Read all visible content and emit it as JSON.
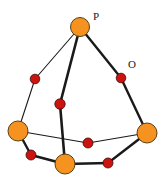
{
  "figure": {
    "background_color": "#ffffff",
    "width": 163,
    "height": 181
  },
  "style": {
    "phosphorus_fill": "#f59220",
    "phosphorus_stroke": "#5a4012",
    "oxygen_fill": "#cc1310",
    "oxygen_stroke": "#3d0a08",
    "bond_color": "#1a1a1a",
    "label_color": "#1a1a1a"
  },
  "labels": {
    "phosphorus": "P",
    "oxygen": "O"
  },
  "label_positions": {
    "phosphorus": {
      "x": 93,
      "y": 20
    },
    "oxygen": {
      "x": 128,
      "y": 68
    }
  },
  "atoms": [
    {
      "id": "P-top",
      "element": "P",
      "x": 80,
      "y": 27,
      "r": 9.5,
      "kind": "phosphorus"
    },
    {
      "id": "P-left",
      "element": "P",
      "x": 18,
      "y": 131,
      "r": 10,
      "kind": "phosphorus"
    },
    {
      "id": "P-right",
      "element": "P",
      "x": 147,
      "y": 133,
      "r": 10,
      "kind": "phosphorus"
    },
    {
      "id": "P-bottom",
      "element": "P",
      "x": 65,
      "y": 164,
      "r": 10,
      "kind": "phosphorus"
    },
    {
      "id": "O-upper-left",
      "element": "O",
      "x": 35,
      "y": 79,
      "r": 4.8,
      "kind": "oxygen"
    },
    {
      "id": "O-upper-right",
      "element": "O",
      "x": 121,
      "y": 78,
      "r": 4.8,
      "kind": "oxygen"
    },
    {
      "id": "O-center",
      "element": "O",
      "x": 60,
      "y": 104,
      "r": 5.2,
      "kind": "oxygen"
    },
    {
      "id": "O-middle",
      "element": "O",
      "x": 88,
      "y": 143,
      "r": 5.0,
      "kind": "oxygen"
    },
    {
      "id": "O-lower-left",
      "element": "O",
      "x": 31,
      "y": 155,
      "r": 5.0,
      "kind": "oxygen"
    },
    {
      "id": "O-lower-right",
      "element": "O",
      "x": 108,
      "y": 163,
      "r": 5.0,
      "kind": "oxygen"
    }
  ],
  "bonds": [
    {
      "from": "P-top",
      "to": "O-upper-left",
      "width": 1.1
    },
    {
      "from": "O-upper-left",
      "to": "P-left",
      "width": 1.1
    },
    {
      "from": "P-top",
      "to": "O-upper-right",
      "width": 2.4
    },
    {
      "from": "O-upper-right",
      "to": "P-right",
      "width": 2.4
    },
    {
      "from": "P-top",
      "to": "O-center",
      "width": 2.6
    },
    {
      "from": "O-center",
      "to": "P-bottom",
      "width": 2.6
    },
    {
      "from": "P-left",
      "to": "O-middle",
      "width": 1.1
    },
    {
      "from": "O-middle",
      "to": "P-right",
      "width": 1.1
    },
    {
      "from": "P-left",
      "to": "O-lower-left",
      "width": 2.4
    },
    {
      "from": "O-lower-left",
      "to": "P-bottom",
      "width": 2.4
    },
    {
      "from": "P-bottom",
      "to": "O-lower-right",
      "width": 2.4
    },
    {
      "from": "O-lower-right",
      "to": "P-right",
      "width": 2.4
    }
  ]
}
